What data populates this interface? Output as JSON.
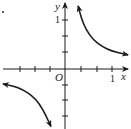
{
  "chart_data": {
    "type": "line",
    "title": "",
    "function_hint": "y = k/x, k > 0 (hyperbola in quadrants I and III)",
    "xlabel": "x",
    "ylabel": "y",
    "origin_label": "O",
    "x_tick_label": "1",
    "y_tick_label": "1",
    "xlim": [
      -1.4,
      1.4
    ],
    "ylim": [
      -1.2,
      1.45
    ],
    "grid": false,
    "ticks_per_unit": 3,
    "x_ticks": [
      -1,
      -0.667,
      -0.333,
      0.333,
      0.667,
      1
    ],
    "y_ticks": [
      1,
      0.667,
      0.333,
      -0.333,
      -0.667,
      -1
    ],
    "series": [
      {
        "name": "branch-quadrant-I",
        "x": [
          0.28,
          0.35,
          0.45,
          0.6,
          0.8,
          1.0,
          1.2,
          1.34
        ],
        "y": [
          1.34,
          1.07,
          0.83,
          0.62,
          0.47,
          0.38,
          0.33,
          0.3
        ]
      },
      {
        "name": "branch-quadrant-III",
        "x": [
          -1.32,
          -1.1,
          -0.9,
          -0.7,
          -0.55,
          -0.4,
          -0.3
        ],
        "y": [
          -0.32,
          -0.36,
          -0.44,
          -0.57,
          -0.73,
          -1.0,
          -1.22
        ]
      }
    ],
    "marker_dot": {
      "x_px": 3,
      "y_px": 12
    }
  },
  "colors": {
    "stroke": "#1a1a1a",
    "background": "#ffffff"
  }
}
